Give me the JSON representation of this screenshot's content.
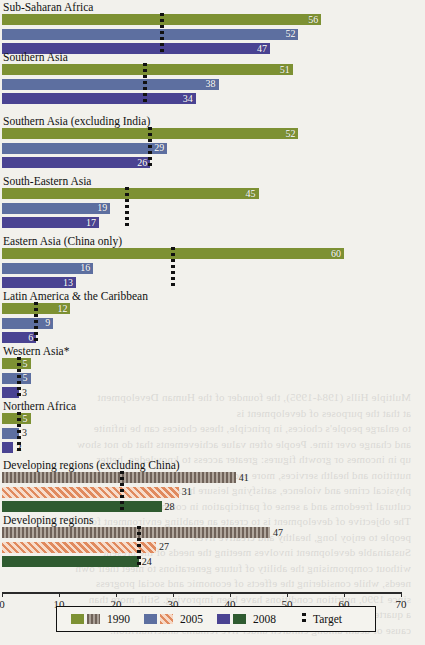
{
  "chart_data": {
    "type": "bar",
    "orientation": "horizontal",
    "title": "",
    "xlabel": "",
    "ylabel": "",
    "xlim": [
      0,
      70
    ],
    "xticks": [
      0,
      10,
      20,
      30,
      40,
      50,
      60,
      70
    ],
    "grid": false,
    "legend_position": "bottom",
    "series": [
      {
        "name": "1990",
        "color": "#7d9133",
        "pattern_color": "#6f6259",
        "pattern": "vertical-stripe"
      },
      {
        "name": "2005",
        "color": "#5d6fa0",
        "pattern_color": "#e08a5e",
        "pattern": "diagonal-hatch"
      },
      {
        "name": "2008",
        "color": "#4a4392",
        "pattern_color": "#2f5b30",
        "pattern": "solid"
      },
      {
        "name": "Target",
        "color": "#111111",
        "pattern": "dotted-line"
      }
    ],
    "categories": [
      "Sub-Saharan Africa",
      "Southern Asia",
      "Southern Asia (excluding India)",
      "South-Eastern Asia",
      "Eastern Asia (China only)",
      "Latin America & the Caribbean",
      "Western Asia*",
      "Northern Africa",
      "Developing regions (excluding China)",
      "Developing regions"
    ],
    "groups": [
      {
        "label": "Sub-Saharan Africa",
        "aggregate": false,
        "values": {
          "1990": 56,
          "2005": 52,
          "2008": 47
        },
        "target": 28
      },
      {
        "label": "Southern Asia",
        "aggregate": false,
        "values": {
          "1990": 51,
          "2005": 38,
          "2008": 34
        },
        "target": 25
      },
      {
        "label": "Southern Asia (excluding India)",
        "aggregate": false,
        "values": {
          "1990": 52,
          "2005": 29,
          "2008": 26
        },
        "target": 26
      },
      {
        "label": "South-Eastern Asia",
        "aggregate": false,
        "values": {
          "1990": 45,
          "2005": 19,
          "2008": 17
        },
        "target": 22
      },
      {
        "label": "Eastern Asia (China only)",
        "aggregate": false,
        "values": {
          "1990": 60,
          "2005": 16,
          "2008": 13
        },
        "target": 30
      },
      {
        "label": "Latin America & the Caribbean",
        "aggregate": false,
        "values": {
          "1990": 12,
          "2005": 9,
          "2008": 6
        },
        "target": 6
      },
      {
        "label": "Western Asia*",
        "aggregate": false,
        "values": {
          "1990": 5,
          "2005": 5,
          "2008": 3
        },
        "target": 3
      },
      {
        "label": "Northern Africa",
        "aggregate": false,
        "values": {
          "1990": 5,
          "2005": 3,
          "2008": 2
        },
        "target": 3
      },
      {
        "label": "Developing regions (excluding China)",
        "aggregate": true,
        "values": {
          "1990": 41,
          "2005": 31,
          "2008": 28
        },
        "target": 21
      },
      {
        "label": "Developing regions",
        "aggregate": true,
        "values": {
          "1990": 47,
          "2005": 27,
          "2008": 24
        },
        "target": 24
      }
    ]
  },
  "legend": {
    "items": [
      {
        "label": "1990"
      },
      {
        "label": "2005"
      },
      {
        "label": "2008"
      },
      {
        "label": "Target"
      }
    ]
  },
  "axis": {
    "tick_labels": [
      "0",
      "10",
      "20",
      "30",
      "40",
      "50",
      "60",
      "70"
    ]
  },
  "bleed_text": [
    "Multiple Hills (1984-1995), the founder of the Human Development",
    "at that the purposes of development is",
    "to enlarge people's choices, in principle, these choices can be infinite",
    "and change over time. People often value achievements that do not show",
    "up in incomes or growth figures: greater access to knowledge, better",
    "nutrition and health services, more secure livelihoods, security against",
    "physical crime and violence, satisfying leisure hours, political and",
    "cultural freedoms and a sense of participation in community activities.",
    "The objective of development is to create an enabling environment for",
    "people to enjoy long, healthy and creative lives.",
    "Sustainable development involves meeting the needs of the present",
    "without compromising the ability of future generations to meet their own",
    "needs, while considering the effects of economic and social progress",
    "since 1990, nutrition conditions have been improving. Still, more than",
    "a quarter of the world's children are underweight, and the most common",
    "cause of death among children under five remains undernutrition."
  ]
}
